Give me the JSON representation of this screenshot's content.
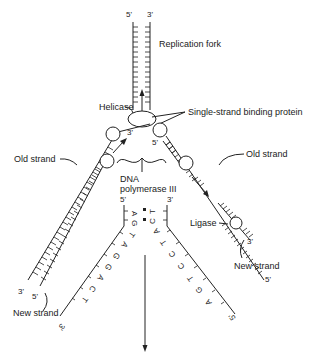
{
  "diagram": {
    "labels": {
      "top_5prime": "5'",
      "top_3prime": "3'",
      "replication_fork": "Replication fork",
      "helicase": "Helicase",
      "ssb": "Single-strand binding protein",
      "old_strand_left": "Old strand",
      "old_strand_right": "Old strand",
      "dna_pol_line1": "DNA",
      "dna_pol_line2": "polymerase III",
      "leading_3prime": "3'",
      "lagging_5prime": "5'",
      "left_3prime": "3'",
      "left_5prime": "5'",
      "new_strand_left": "New strand",
      "right_5prime": "5'",
      "right_3prime": "3'",
      "ligase": "Ligase",
      "new_strand_right": "New strand"
    },
    "sequence_detail": {
      "left_top_5prime": "5'",
      "right_top_3prime": "3'",
      "left_end_3prime": "3'",
      "right_end_5prime": "5'",
      "left_vertical_bases": [
        "A"
      ],
      "right_vertical_bases": [
        "T"
      ],
      "left_diagonal_bases": [
        "G",
        "T",
        "A",
        "G",
        "G",
        "A",
        "C",
        "T"
      ],
      "right_diagonal_bases": [
        "C",
        "A",
        "T",
        "C",
        "C",
        "T",
        "G",
        "A"
      ],
      "pairs": [
        {
          "left": "A",
          "right": "T"
        },
        {
          "left": "G",
          "right": "C"
        }
      ]
    }
  }
}
